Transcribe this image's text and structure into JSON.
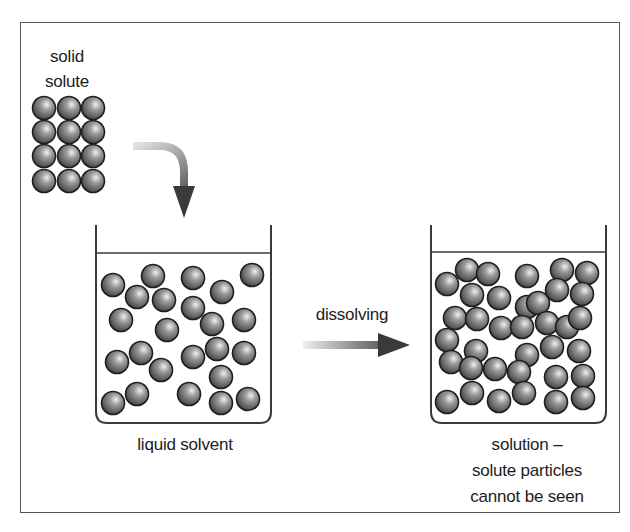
{
  "diagram": {
    "labels": {
      "solid_solute": [
        "solid",
        "solute"
      ],
      "liquid_solvent": "liquid solvent",
      "process": "dissolving",
      "solution": [
        "solution –",
        "solute particles",
        "cannot be seen"
      ]
    },
    "colors": {
      "frame": "#555555",
      "beaker": "#3a3a3a",
      "particle_outline": "#1e1e1e",
      "particle_light": "#e6e6e6",
      "particle_mid": "#8a8a8a",
      "particle_dark": "#444444",
      "arrow_light": "#d8d8d8",
      "arrow_dark": "#3c3c3c"
    },
    "particle_radius": 11.5,
    "solid_grid": {
      "columns": [
        44,
        69,
        93
      ],
      "rows": [
        108,
        132,
        156,
        181
      ]
    },
    "solvent_particles": [
      [
        113,
        285
      ],
      [
        153,
        276
      ],
      [
        193,
        278
      ],
      [
        252,
        275
      ],
      [
        137,
        297
      ],
      [
        164,
        300
      ],
      [
        222,
        292
      ],
      [
        193,
        308
      ],
      [
        121,
        320
      ],
      [
        167,
        330
      ],
      [
        212,
        324
      ],
      [
        244,
        320
      ],
      [
        117,
        362
      ],
      [
        141,
        353
      ],
      [
        161,
        370
      ],
      [
        193,
        357
      ],
      [
        217,
        349
      ],
      [
        244,
        353
      ],
      [
        221,
        377
      ],
      [
        113,
        403
      ],
      [
        137,
        394
      ],
      [
        189,
        394
      ],
      [
        221,
        403
      ],
      [
        248,
        399
      ]
    ],
    "solution_particles": [
      [
        447,
        284
      ],
      [
        467,
        270
      ],
      [
        488,
        274
      ],
      [
        527,
        276
      ],
      [
        562,
        270
      ],
      [
        587,
        273
      ],
      [
        472,
        295
      ],
      [
        499,
        298
      ],
      [
        557,
        290
      ],
      [
        582,
        294
      ],
      [
        527,
        307
      ],
      [
        538,
        303
      ],
      [
        455,
        318
      ],
      [
        477,
        319
      ],
      [
        501,
        328
      ],
      [
        522,
        327
      ],
      [
        547,
        323
      ],
      [
        567,
        327
      ],
      [
        580,
        318
      ],
      [
        447,
        340
      ],
      [
        451,
        362
      ],
      [
        476,
        351
      ],
      [
        471,
        368
      ],
      [
        495,
        369
      ],
      [
        527,
        355
      ],
      [
        519,
        372
      ],
      [
        552,
        347
      ],
      [
        579,
        351
      ],
      [
        556,
        377
      ],
      [
        583,
        376
      ],
      [
        447,
        402
      ],
      [
        472,
        393
      ],
      [
        499,
        401
      ],
      [
        524,
        393
      ],
      [
        556,
        402
      ],
      [
        583,
        398
      ]
    ]
  }
}
